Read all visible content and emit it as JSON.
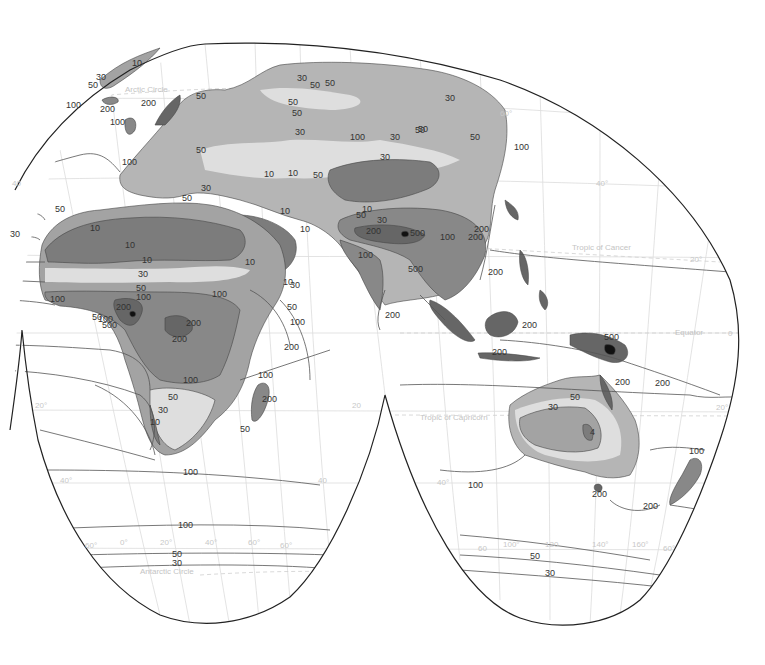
{
  "map": {
    "type": "world isohyet map (interrupted projection)",
    "colors": {
      "background": "#ffffff",
      "ocean": "#ffffff",
      "outline": "#222222",
      "graticule": "#dcdcdc",
      "isohyet": "#555555",
      "class_lt10": "#7c7c7c",
      "class_10_30": "#a3a3a3",
      "class_30_50": "#dedede",
      "class_50_100": "#b5b5b5",
      "class_100_200": "#888888",
      "class_200_500": "#666666",
      "class_gt500": "#111111"
    },
    "reference_lines": {
      "arctic": "Arctic Circle",
      "cancer": "Tropic of Cancer",
      "equator": "Equator",
      "capricorn": "Tropic of Capricorn",
      "antarctic": "Antarctic Circle"
    },
    "graticule_labels": {
      "lat_60n": "60°",
      "lat_40n_left": "40",
      "lat_40n_right": "40°",
      "lat_20n": "20°",
      "lat_0": "0",
      "lat_20s_left": "20°",
      "lat_20s_mid": "20",
      "lat_20s_right": "20°",
      "lat_40s_left": "40°",
      "lat_40s_mid": "40",
      "lat_40s_right": "40°",
      "lat_60s_1": "60°",
      "lon_0": "0°",
      "lon_20": "20°",
      "lon_40": "40°",
      "lon_60": "60°",
      "lat_60s_2": "60°",
      "lat_60s_3": "60",
      "lon_100": "100°",
      "lon_120": "120",
      "lon_140": "140°",
      "lon_160": "160°",
      "lat_60s_4": "60°"
    },
    "isohyet_labels": {
      "europe": [
        "10",
        "30",
        "50",
        "100",
        "200",
        "200",
        "100",
        "50",
        "50",
        "100",
        "10",
        "10",
        "50",
        "30",
        "50",
        "30",
        "50",
        "50",
        "50",
        "30",
        "30",
        "100",
        "50",
        "50",
        "30",
        "30",
        "50",
        "50",
        "100"
      ],
      "africa": [
        "50",
        "30",
        "10",
        "10",
        "10",
        "30",
        "50",
        "100",
        "100",
        "200",
        "50",
        "100",
        "500",
        "200",
        "200",
        "100",
        "10",
        "10",
        "10",
        "10",
        "30",
        "50",
        "100",
        "200",
        "100",
        "50",
        "30",
        "10",
        "100",
        "200",
        "50"
      ],
      "asia": [
        "10",
        "50",
        "30",
        "200",
        "500",
        "100",
        "200",
        "200",
        "100",
        "500",
        "200",
        "200"
      ],
      "oceania": [
        "200",
        "200",
        "500",
        "200",
        "200",
        "50",
        "30",
        "4",
        "100",
        "200",
        "200"
      ],
      "south_ocean": [
        "100",
        "100",
        "50",
        "30",
        "100",
        "50",
        "30"
      ]
    }
  }
}
